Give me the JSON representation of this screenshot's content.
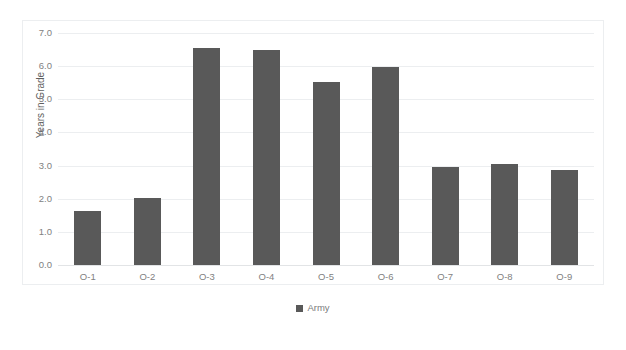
{
  "chart_data": {
    "type": "bar",
    "title": "",
    "xlabel": "",
    "ylabel": "Years in Grade",
    "categories": [
      "O-1",
      "O-2",
      "O-3",
      "O-4",
      "O-5",
      "O-6",
      "O-7",
      "O-8",
      "O-9"
    ],
    "series": [
      {
        "name": "Army",
        "color": "#595959",
        "values": [
          1.62,
          2.03,
          6.55,
          6.48,
          5.52,
          5.97,
          2.97,
          3.06,
          2.87
        ]
      }
    ],
    "ylim": [
      0.0,
      7.0
    ],
    "ytick_step": 1.0,
    "ytick_labels": [
      "7.0",
      "6.0",
      "5.0",
      "4.0",
      "3.0",
      "2.0",
      "1.0",
      "0.0"
    ],
    "ytick_values": [
      7.0,
      6.0,
      5.0,
      4.0,
      3.0,
      2.0,
      1.0,
      0.0
    ],
    "grid": true,
    "grid_axis": "y",
    "legend_position": "bottom",
    "legend_entries": [
      "Army"
    ]
  },
  "colors": {
    "bar": "#595959",
    "gridline": "#eceef0",
    "frame": "#eceef0",
    "tick_text": "#818181",
    "axis_title_text": "#5f5f5f",
    "legend_text": "#7b7b7b",
    "background": "#ffffff"
  },
  "axes": {
    "y_title": "Years in Grade"
  },
  "title": {
    "text": ""
  }
}
